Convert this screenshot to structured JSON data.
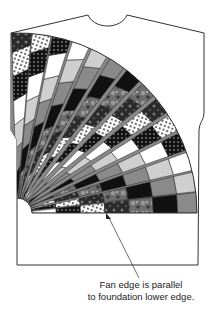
{
  "figure": {
    "type": "quilt-garment-diagram",
    "caption": {
      "line1": "Fan edge is parallel",
      "line2": "to foundation lower edge."
    },
    "colors": {
      "outline": "#333333",
      "black": "#111111",
      "dark_gray": "#555555",
      "mid_gray": "#8a8a8a",
      "light_gray": "#cfcfcf",
      "white": "#ffffff"
    }
  }
}
